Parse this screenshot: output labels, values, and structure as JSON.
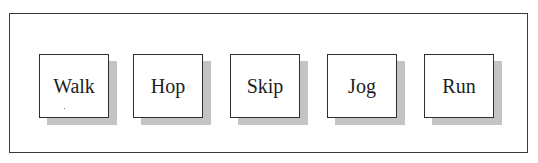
{
  "diagram": {
    "nodes": [
      {
        "label": "Walk",
        "x": 39
      },
      {
        "label": "Hop",
        "x": 133
      },
      {
        "label": "Skip",
        "x": 230
      },
      {
        "label": "Jog",
        "x": 327
      },
      {
        "label": "Run",
        "x": 424
      }
    ]
  }
}
